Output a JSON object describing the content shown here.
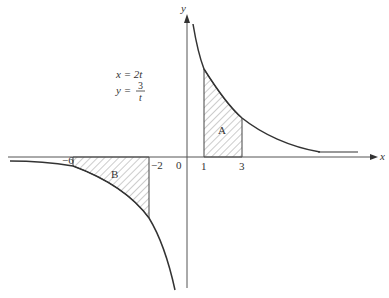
{
  "diagram": {
    "type": "parametric curve with shaded areas",
    "equations": {
      "x_eq": "x = 2t",
      "y_lhs": "y =",
      "y_num": "3",
      "y_den": "t"
    },
    "axes": {
      "x_label": "x",
      "y_label": "y",
      "origin_label": "0"
    },
    "ticks": {
      "neg6": "−6",
      "neg2": "−2",
      "pos1": "1",
      "pos3": "3"
    },
    "regions": {
      "A": "A",
      "B": "B"
    },
    "colors": {
      "line": "#333333",
      "axis": "#555555",
      "hatch": "#888888"
    }
  }
}
